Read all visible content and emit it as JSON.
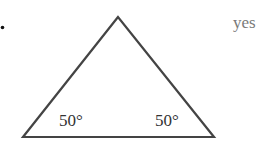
{
  "bullet": "•",
  "answer": {
    "text": "yes",
    "color": "#7a7a7a"
  },
  "triangle": {
    "vertices": {
      "apex": [
        118,
        17
      ],
      "bottom_left": [
        23,
        137
      ],
      "bottom_right": [
        214,
        137
      ]
    },
    "stroke_color": "#444444",
    "angles": [
      {
        "position": "bottom-left",
        "label": "50°"
      },
      {
        "position": "bottom-right",
        "label": "50°"
      }
    ]
  }
}
